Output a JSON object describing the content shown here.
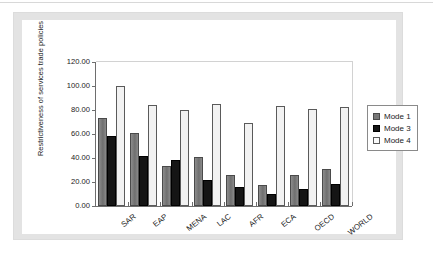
{
  "chart_data": {
    "type": "bar",
    "title": "",
    "subtitle": "",
    "xlabel": "",
    "ylabel": "Restrictiveness of services trade policies",
    "ylim": [
      0,
      120
    ],
    "ytick_labels": [
      "120.00",
      "100.00",
      "80.00",
      "60.00",
      "40.00",
      "20.00",
      "0.00"
    ],
    "ytick_values": [
      120,
      100,
      80,
      60,
      40,
      20,
      0
    ],
    "grid": false,
    "legend_position": "right",
    "categories": [
      "SAR",
      "EAP",
      "MENA",
      "LAC",
      "AFR",
      "ECA",
      "OECD",
      "WORLD"
    ],
    "series": [
      {
        "name": "Mode 1",
        "color": "#787878",
        "values": [
          73.0,
          61.0,
          33.5,
          41.0,
          26.0,
          17.5,
          26.0,
          31.0
        ]
      },
      {
        "name": "Mode 3",
        "color": "#151515",
        "values": [
          58.0,
          41.5,
          38.0,
          22.0,
          16.0,
          10.0,
          14.0,
          18.0
        ]
      },
      {
        "name": "Mode 4",
        "color": "#f2f2f2",
        "values": [
          100.0,
          84.0,
          80.0,
          85.0,
          69.0,
          83.0,
          81.0,
          82.5
        ]
      }
    ]
  },
  "legend": {
    "items": [
      {
        "label": "Mode 1",
        "swatch": "mode-1-swatch"
      },
      {
        "label": "Mode 3",
        "swatch": "mode-3-swatch"
      },
      {
        "label": "Mode 4",
        "swatch": "mode-4-swatch"
      }
    ]
  }
}
